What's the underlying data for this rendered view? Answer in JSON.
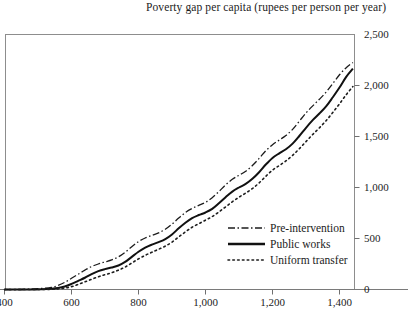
{
  "chart_data": {
    "type": "line",
    "title": "Poverty gap per capita (rupees per person per year)",
    "xlabel": "",
    "ylabel": "",
    "xlim": [
      400,
      1450
    ],
    "ylim": [
      0,
      2500
    ],
    "xticks": [
      400,
      600,
      800,
      1000,
      1200,
      1400
    ],
    "xtick_labels": [
      "400",
      "600",
      "800",
      "1,000",
      "1,200",
      "1,400"
    ],
    "yticks": [
      0,
      500,
      1000,
      1500,
      2000,
      2500
    ],
    "ytick_labels": [
      "0",
      "500",
      "1,000",
      "1,500",
      "2,000",
      "2,500"
    ],
    "y_axis_side": "right",
    "grid": false,
    "legend_position": "bottom-right",
    "series": [
      {
        "name": "Pre-intervention",
        "style": "dash-dot",
        "color": "#1c1c1c",
        "x": [
          400,
          440,
          480,
          510,
          540,
          560,
          580,
          600,
          620,
          640,
          660,
          680,
          700,
          720,
          740,
          760,
          780,
          800,
          820,
          840,
          860,
          880,
          900,
          920,
          940,
          960,
          980,
          1000,
          1020,
          1040,
          1060,
          1080,
          1100,
          1120,
          1140,
          1160,
          1180,
          1200,
          1220,
          1240,
          1260,
          1280,
          1300,
          1320,
          1340,
          1360,
          1380,
          1400,
          1420,
          1440
        ],
        "values": [
          0,
          0,
          5,
          10,
          20,
          40,
          70,
          110,
          150,
          190,
          225,
          250,
          270,
          290,
          320,
          365,
          420,
          470,
          505,
          530,
          555,
          590,
          640,
          700,
          755,
          795,
          825,
          855,
          900,
          960,
          1025,
          1080,
          1120,
          1160,
          1215,
          1285,
          1360,
          1420,
          1465,
          1510,
          1570,
          1650,
          1730,
          1800,
          1865,
          1935,
          2020,
          2105,
          2175,
          2225
        ]
      },
      {
        "name": "Public works",
        "style": "solid",
        "color": "#111111",
        "x": [
          400,
          440,
          480,
          510,
          540,
          560,
          580,
          600,
          620,
          640,
          660,
          680,
          700,
          720,
          740,
          760,
          780,
          800,
          820,
          840,
          860,
          880,
          900,
          920,
          940,
          960,
          980,
          1000,
          1020,
          1040,
          1060,
          1080,
          1100,
          1120,
          1140,
          1160,
          1180,
          1200,
          1220,
          1240,
          1260,
          1280,
          1300,
          1320,
          1340,
          1360,
          1380,
          1400,
          1420,
          1440
        ],
        "values": [
          0,
          0,
          0,
          3,
          8,
          15,
          30,
          55,
          85,
          115,
          150,
          180,
          200,
          215,
          235,
          270,
          320,
          370,
          410,
          440,
          465,
          495,
          540,
          600,
          655,
          700,
          730,
          755,
          790,
          845,
          905,
          960,
          1000,
          1035,
          1085,
          1150,
          1225,
          1290,
          1335,
          1375,
          1430,
          1505,
          1585,
          1660,
          1725,
          1795,
          1885,
          1980,
          2085,
          2165
        ]
      },
      {
        "name": "Uniform transfer",
        "style": "dotted",
        "color": "#1c1c1c",
        "x": [
          400,
          440,
          480,
          510,
          540,
          560,
          580,
          600,
          620,
          640,
          660,
          680,
          700,
          720,
          740,
          760,
          780,
          800,
          820,
          840,
          860,
          880,
          900,
          920,
          940,
          960,
          980,
          1000,
          1020,
          1040,
          1060,
          1080,
          1100,
          1120,
          1140,
          1160,
          1180,
          1200,
          1220,
          1240,
          1260,
          1280,
          1300,
          1320,
          1340,
          1360,
          1380,
          1400,
          1420,
          1440
        ],
        "values": [
          0,
          0,
          0,
          0,
          2,
          6,
          14,
          28,
          50,
          75,
          100,
          125,
          145,
          165,
          190,
          220,
          260,
          300,
          335,
          365,
          395,
          425,
          465,
          515,
          565,
          610,
          645,
          680,
          715,
          760,
          810,
          860,
          905,
          945,
          990,
          1045,
          1110,
          1170,
          1215,
          1260,
          1315,
          1380,
          1450,
          1520,
          1585,
          1655,
          1735,
          1820,
          1910,
          1990
        ]
      }
    ]
  },
  "legend": {
    "items": [
      {
        "label": "Pre-intervention"
      },
      {
        "label": "Public works"
      },
      {
        "label": "Uniform transfer"
      }
    ]
  }
}
